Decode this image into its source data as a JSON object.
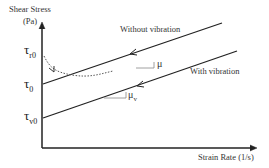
{
  "axes": {
    "y_label_line1": "Shear Stress",
    "y_label_line2": "(Pa)",
    "x_label": "Strain Rate (1/s)"
  },
  "curves": {
    "without_vibration": "Without vibration",
    "with_vibration": "With vibration"
  },
  "symbols": {
    "tau": "τ",
    "tau_r0_sub": "r0",
    "tau_0_sub": "0",
    "tau_v0_sub": "v0",
    "mu": "μ",
    "mu_v_sub": "v"
  }
}
